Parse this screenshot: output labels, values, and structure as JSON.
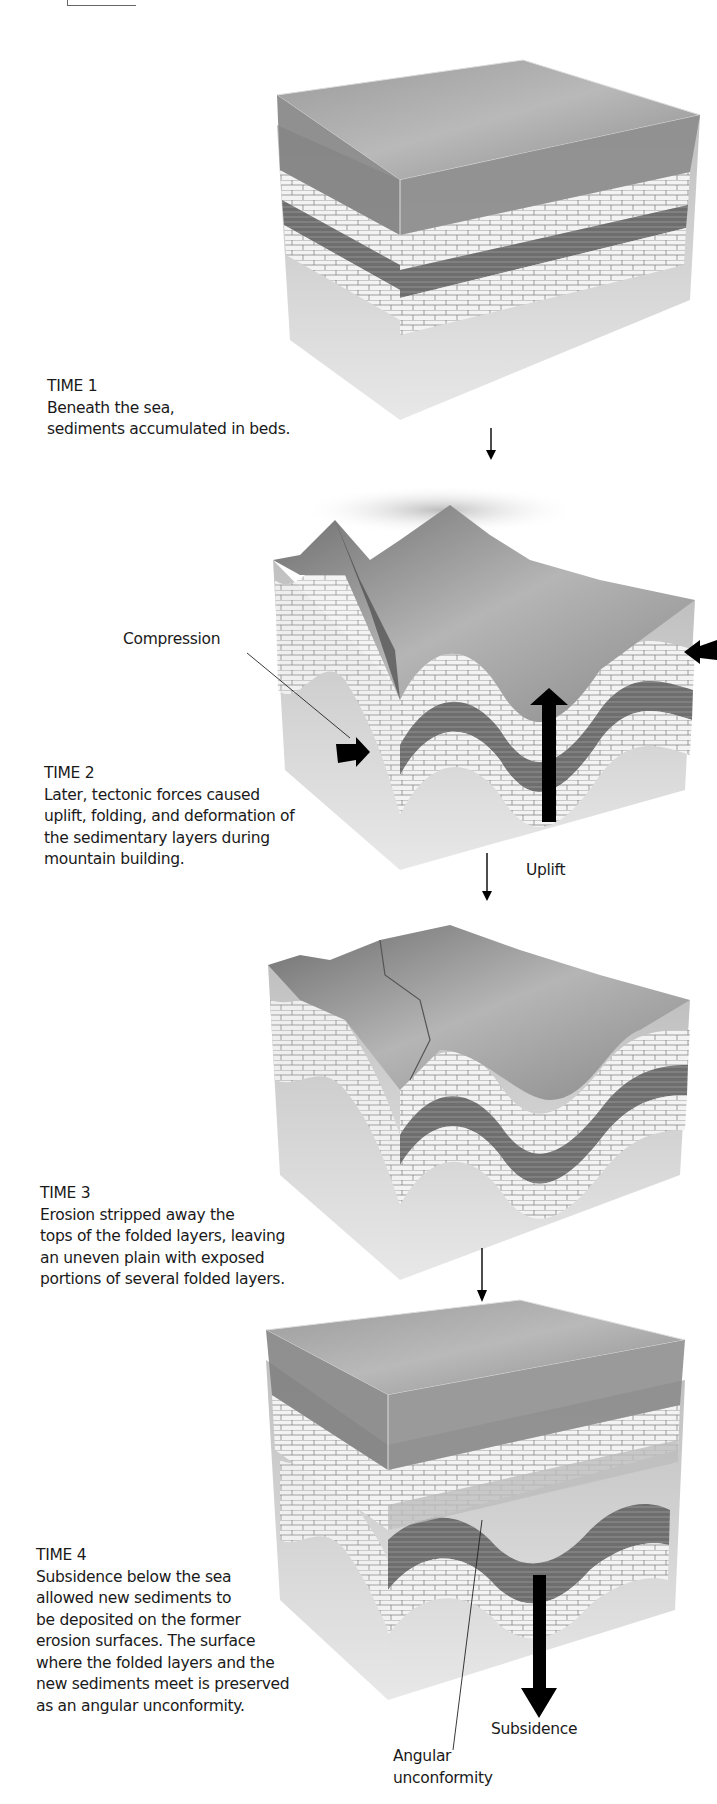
{
  "figure": {
    "stages": [
      {
        "title": "TIME 1",
        "lines": [
          "Beneath the sea,",
          "sediments accumulated in beds."
        ]
      },
      {
        "title": "TIME 2",
        "lines": [
          "Later, tectonic forces caused",
          "uplift, folding, and deformation of",
          "the sedimentary layers during",
          "mountain building."
        ]
      },
      {
        "title": "TIME 3",
        "lines": [
          "Erosion stripped away the",
          "tops of the folded layers, leaving",
          "an uneven plain with exposed",
          "portions of several folded layers."
        ]
      },
      {
        "title": "TIME 4",
        "lines": [
          "Subsidence below the sea",
          "allowed new sediments to",
          "be deposited on the former",
          "erosion surfaces. The surface",
          "where the folded layers and the",
          "new sediments meet is preserved",
          "as an angular unconformity."
        ]
      }
    ],
    "labels": {
      "compression": "Compression",
      "uplift": "Uplift",
      "subsidence": "Subsidence",
      "angular_unconformity_line1": "Angular",
      "angular_unconformity_line2": "unconformity"
    },
    "colors": {
      "water": "#8a8a8a",
      "limestone": "#f2f2f2",
      "shale": "#6a6a6a",
      "basement": "#c4c4c4",
      "arrow": "#000000"
    }
  }
}
